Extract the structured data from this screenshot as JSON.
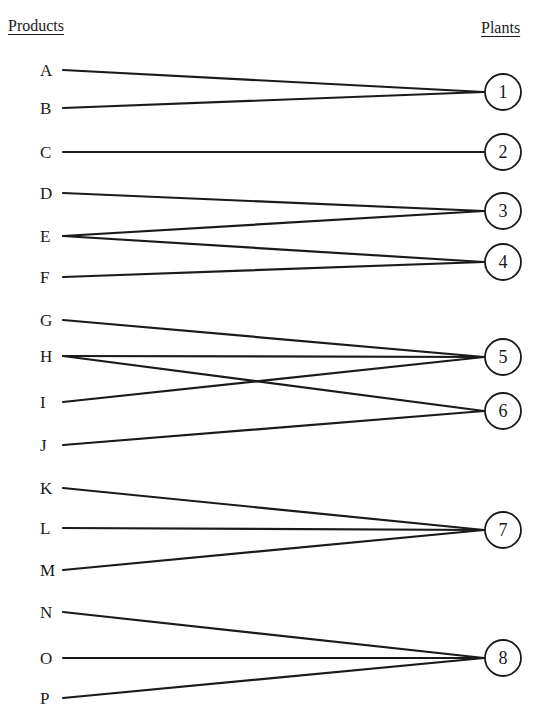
{
  "headers": {
    "products": "Products",
    "plants": "Plants"
  },
  "products": [
    {
      "id": "A",
      "y": 70
    },
    {
      "id": "B",
      "y": 108
    },
    {
      "id": "C",
      "y": 152
    },
    {
      "id": "D",
      "y": 193
    },
    {
      "id": "E",
      "y": 236
    },
    {
      "id": "F",
      "y": 277
    },
    {
      "id": "G",
      "y": 320
    },
    {
      "id": "H",
      "y": 356
    },
    {
      "id": "I",
      "y": 402
    },
    {
      "id": "J",
      "y": 445
    },
    {
      "id": "K",
      "y": 488
    },
    {
      "id": "L",
      "y": 528
    },
    {
      "id": "M",
      "y": 570
    },
    {
      "id": "N",
      "y": 612
    },
    {
      "id": "O",
      "y": 658
    },
    {
      "id": "P",
      "y": 698
    }
  ],
  "plants": [
    {
      "id": "1",
      "y": 92
    },
    {
      "id": "2",
      "y": 152
    },
    {
      "id": "3",
      "y": 211
    },
    {
      "id": "4",
      "y": 262
    },
    {
      "id": "5",
      "y": 357
    },
    {
      "id": "6",
      "y": 411
    },
    {
      "id": "7",
      "y": 530
    },
    {
      "id": "8",
      "y": 658
    }
  ],
  "edges": [
    [
      "A",
      "1"
    ],
    [
      "B",
      "1"
    ],
    [
      "C",
      "2"
    ],
    [
      "D",
      "3"
    ],
    [
      "E",
      "3"
    ],
    [
      "E",
      "4"
    ],
    [
      "F",
      "4"
    ],
    [
      "G",
      "5"
    ],
    [
      "H",
      "5"
    ],
    [
      "I",
      "5"
    ],
    [
      "H",
      "6"
    ],
    [
      "J",
      "6"
    ],
    [
      "K",
      "7"
    ],
    [
      "L",
      "7"
    ],
    [
      "M",
      "7"
    ],
    [
      "N",
      "8"
    ],
    [
      "O",
      "8"
    ],
    [
      "P",
      "8"
    ]
  ],
  "style": {
    "line_color": "#1a1a1a",
    "background": "#ffffff"
  }
}
